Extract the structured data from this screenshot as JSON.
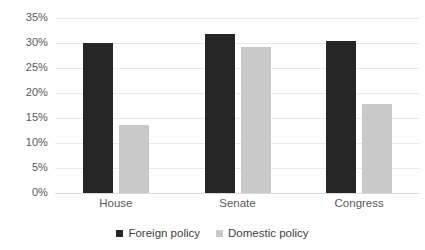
{
  "chart_data": {
    "type": "bar",
    "title": "",
    "subtitle": "",
    "xlabel": "",
    "ylabel": "",
    "categories": [
      "House",
      "Senate",
      "Congress"
    ],
    "series": [
      {
        "name": "Foreign policy",
        "color": "#262626",
        "values": [
          30.0,
          31.8,
          30.4
        ]
      },
      {
        "name": "Domestic policy",
        "color": "#c9c9c9",
        "values": [
          13.6,
          29.2,
          17.8
        ]
      }
    ],
    "ylim": [
      0,
      35
    ],
    "ytick_step": 5,
    "ytick_labels": [
      "35%",
      "30%",
      "25%",
      "20%",
      "15%",
      "10%",
      "5%",
      "0%"
    ],
    "ytick_values": [
      35,
      30,
      25,
      20,
      15,
      10,
      5,
      0
    ],
    "value_suffix": "%",
    "grid": true,
    "grid_color": "#e8e8e8",
    "legend_position": "bottom",
    "background": "#ffffff"
  }
}
